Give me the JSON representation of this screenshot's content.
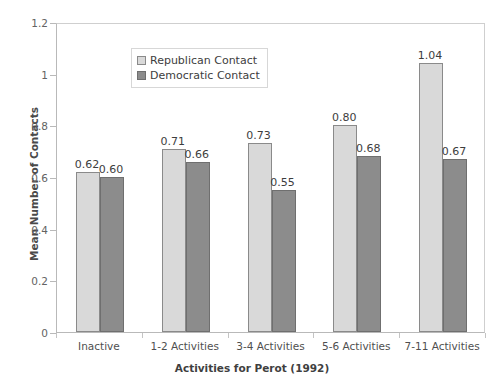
{
  "chart_data": {
    "type": "bar",
    "title": "",
    "xlabel": "Activities for Perot (1992)",
    "ylabel": "Mean Number of Contacts",
    "categories": [
      "Inactive",
      "1-2 Activities",
      "3-4 Activities",
      "5-6 Activities",
      "7-11 Activities"
    ],
    "series": [
      {
        "name": "Republican Contact",
        "color": "#d9d9d9",
        "values": [
          0.62,
          0.71,
          0.73,
          0.8,
          1.04
        ],
        "labels": [
          "0.62",
          "0.71",
          "0.73",
          "0.80",
          "1.04"
        ]
      },
      {
        "name": "Democratic Contact",
        "color": "#8c8c8c",
        "values": [
          0.6,
          0.66,
          0.55,
          0.68,
          0.67
        ],
        "labels": [
          "0.60",
          "0.66",
          "0.55",
          "0.68",
          "0.67"
        ]
      }
    ],
    "ylim": [
      0,
      1.2
    ],
    "yticks": [
      0,
      0.2,
      0.4,
      0.6,
      0.8,
      1,
      1.2
    ],
    "ytick_labels": [
      "0",
      "0.2",
      "0.4",
      "0.6",
      "0.8",
      "1",
      "1.2"
    ],
    "grid": false,
    "legend_position": "upper-center-left"
  },
  "legend": {
    "items": [
      {
        "label": "Republican Contact"
      },
      {
        "label": "Democratic Contact"
      }
    ]
  },
  "axes": {
    "y_title": "Mean Number of Contacts",
    "x_title": "Activities for Perot (1992)"
  }
}
